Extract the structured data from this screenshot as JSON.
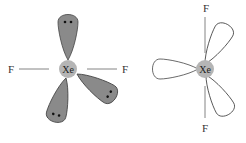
{
  "diagrams": [
    {
      "name": "lone-pair-orbitals",
      "center_label": "Xe",
      "ligands": [
        "F",
        "F"
      ],
      "lobe_fill": "#8a8a8a",
      "lobes": 3
    },
    {
      "name": "open-orbitals",
      "center_label": "Xe",
      "ligands": [
        "F",
        "F",
        "F"
      ],
      "lobe_fill": "#ffffff",
      "lobes": 3
    }
  ],
  "colors": {
    "atom": "#b5b5b5",
    "stroke": "#444444",
    "bond": "#777777"
  }
}
